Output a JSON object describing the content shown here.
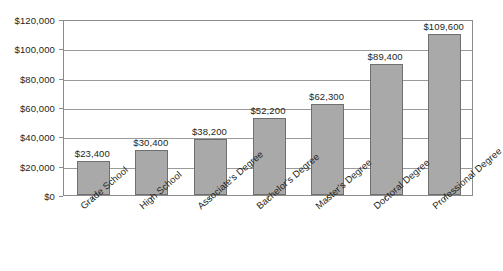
{
  "chart_data": {
    "type": "bar",
    "title": "",
    "xlabel": "",
    "ylabel": "",
    "categories": [
      "Grade School",
      "High School",
      "Associate's Degree",
      "Bachelor's Degree",
      "Master's Degree",
      "Doctoral Degree",
      "Professional Degree"
    ],
    "values": [
      23400,
      30400,
      38200,
      52200,
      62300,
      89400,
      109600
    ],
    "value_labels": [
      "$23,400",
      "$30,400",
      "$38,200",
      "$52,200",
      "$62,300",
      "$89,400",
      "$109,600"
    ],
    "ylim": [
      0,
      120000
    ],
    "ytick_values": [
      0,
      20000,
      40000,
      60000,
      80000,
      100000,
      120000
    ],
    "ytick_labels": [
      "$0",
      "$20,000",
      "$40,000",
      "$60,000",
      "$80,000",
      "$100,000",
      "$120,000"
    ],
    "grid": true,
    "legend": false,
    "bar_color": "#a9a9a9",
    "bar_border_color": "#6f6f6f",
    "gridline_color": "#9a9a9a",
    "axis_color": "#8c8c8c",
    "background_color": "#ffffff",
    "text_color": "#231f20"
  }
}
